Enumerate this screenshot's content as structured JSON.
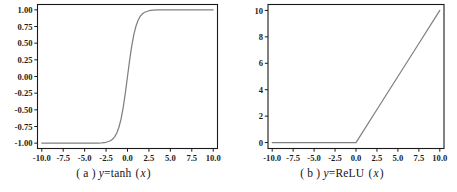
{
  "figure": {
    "background": "#ffffff",
    "axis_color": "#1a1a1a",
    "line_color": "#808080",
    "panels": [
      "a",
      "b"
    ]
  },
  "panel_a": {
    "caption_index": "( a )",
    "caption_lhs": "y",
    "caption_eq": "=tanh",
    "caption_arg_open": "(",
    "caption_arg": "x",
    "caption_arg_close": ")",
    "caption_full": "( a ) y=tanh ( x )",
    "xticks": [
      "-10.0",
      "-7.5",
      "-5.0",
      "-2.5",
      "0.0",
      "2.5",
      "5.0",
      "7.5",
      "10.0"
    ],
    "yticks": [
      "1.00",
      "0.75",
      "0.50",
      "0.25",
      "0.00",
      "-0.25",
      "-0.50",
      "-0.75",
      "-1.00"
    ]
  },
  "panel_b": {
    "caption_index": "( b )",
    "caption_lhs": "y",
    "caption_eq": "=ReLU",
    "caption_arg_open": "(",
    "caption_arg": "x",
    "caption_arg_close": ")",
    "caption_full": "( b ) y=ReLU ( x )",
    "xticks": [
      "-10.0",
      "-7.5",
      "-5.0",
      "-2.5",
      "0.0",
      "2.5",
      "5.0",
      "7.5",
      "10.0"
    ],
    "yticks": [
      "0",
      "2",
      "4",
      "6",
      "8",
      "10"
    ]
  },
  "chart_data": [
    {
      "type": "line",
      "title": "( a ) y=tanh ( x )",
      "xlabel": "",
      "ylabel": "",
      "xlim": [
        -10.5,
        10.5
      ],
      "ylim": [
        -1.08,
        1.08
      ],
      "xticks": [
        -10.0,
        -7.5,
        -5.0,
        -2.5,
        0.0,
        2.5,
        5.0,
        7.5,
        10.0
      ],
      "yticks": [
        1.0,
        0.75,
        0.5,
        0.25,
        0.0,
        -0.25,
        -0.5,
        -0.75,
        -1.0
      ],
      "grid": false,
      "legend": null,
      "series": [
        {
          "name": "tanh(x)",
          "color": "#808080",
          "x": [
            -10.0,
            -9.0,
            -8.0,
            -7.0,
            -6.0,
            -5.0,
            -4.5,
            -4.0,
            -3.5,
            -3.0,
            -2.5,
            -2.0,
            -1.75,
            -1.5,
            -1.25,
            -1.0,
            -0.75,
            -0.5,
            -0.25,
            0.0,
            0.25,
            0.5,
            0.75,
            1.0,
            1.25,
            1.5,
            1.75,
            2.0,
            2.5,
            3.0,
            3.5,
            4.0,
            4.5,
            5.0,
            6.0,
            7.0,
            8.0,
            9.0,
            10.0
          ],
          "y": [
            -1.0,
            -1.0,
            -1.0,
            -1.0,
            -0.99999,
            -0.9999,
            -0.99975,
            -0.99933,
            -0.99818,
            -0.99505,
            -0.98661,
            -0.96403,
            -0.94138,
            -0.90515,
            -0.84828,
            -0.76159,
            -0.63515,
            -0.46212,
            -0.24492,
            0.0,
            0.24492,
            0.46212,
            0.63515,
            0.76159,
            0.84828,
            0.90515,
            0.94138,
            0.96403,
            0.98661,
            0.99505,
            0.99818,
            0.99933,
            0.99975,
            0.9999,
            0.99999,
            1.0,
            1.0,
            1.0,
            1.0
          ]
        }
      ]
    },
    {
      "type": "line",
      "title": "( b ) y=ReLU ( x )",
      "xlabel": "",
      "ylabel": "",
      "xlim": [
        -10.5,
        10.5
      ],
      "ylim": [
        -0.45,
        10.45
      ],
      "xticks": [
        -10.0,
        -7.5,
        -5.0,
        -2.5,
        0.0,
        2.5,
        5.0,
        7.5,
        10.0
      ],
      "yticks": [
        0,
        2,
        4,
        6,
        8,
        10
      ],
      "grid": false,
      "legend": null,
      "series": [
        {
          "name": "ReLU(x)",
          "color": "#808080",
          "x": [
            -10.0,
            -7.5,
            -5.0,
            -2.5,
            0.0,
            2.5,
            5.0,
            7.5,
            10.0
          ],
          "y": [
            0.0,
            0.0,
            0.0,
            0.0,
            0.0,
            2.5,
            5.0,
            7.5,
            10.0
          ]
        }
      ]
    }
  ]
}
